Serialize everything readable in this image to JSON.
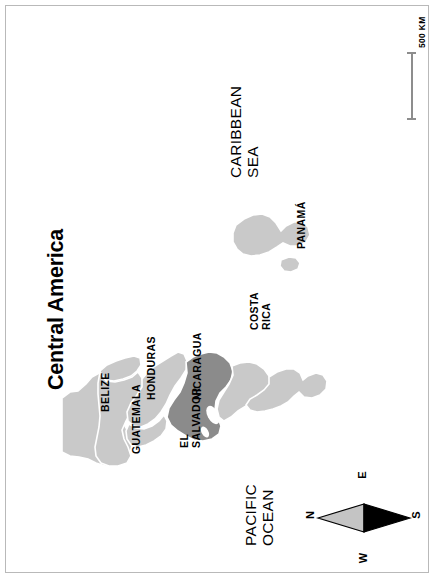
{
  "map": {
    "title": "Central America",
    "orientation_note": "rotated",
    "colors": {
      "light_land": "#c9c9c9",
      "highlight_land": "#8b8b8b",
      "water": "#ffffff",
      "frame": "#b9b9b9",
      "text": "#000000",
      "scale_bar": "#8d8d8d"
    },
    "oceans": [
      {
        "id": "caribbean",
        "line1": "CARIBBEAN",
        "line2": "SEA"
      },
      {
        "id": "pacific",
        "line1": "PACIFIC",
        "line2": "OCEAN"
      }
    ],
    "countries": [
      {
        "id": "belize",
        "line1": "BELIZE",
        "line2": "",
        "highlighted": false
      },
      {
        "id": "guatemala",
        "line1": "GUATEMALA",
        "line2": "",
        "highlighted": false
      },
      {
        "id": "honduras",
        "line1": "HONDURAS",
        "line2": "",
        "highlighted": false
      },
      {
        "id": "el-salvador",
        "line1": "EL",
        "line2": "SALVADOR",
        "highlighted": false
      },
      {
        "id": "nicaragua",
        "line1": "NICARAGUA",
        "line2": "",
        "highlighted": true
      },
      {
        "id": "costa-rica",
        "line1": "COSTA",
        "line2": "RICA",
        "highlighted": false
      },
      {
        "id": "panama",
        "line1": "PANAMÁ",
        "line2": "",
        "highlighted": false
      }
    ],
    "scale": {
      "label": "500 KM",
      "distance_value": "500",
      "distance_unit": "KM"
    },
    "compass": {
      "north": "N",
      "south": "S",
      "east": "E",
      "west": "W"
    }
  }
}
